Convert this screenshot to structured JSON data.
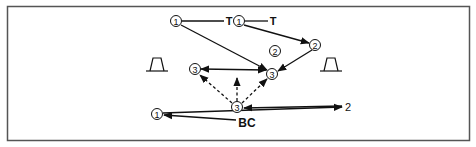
{
  "diagram": {
    "type": "traffic/route flow diagram",
    "border_color": "#555555",
    "line_color": "#111111",
    "nodes": [
      {
        "id": "n1a",
        "label": "1",
        "shape": "circle",
        "x": 176,
        "y": 21
      },
      {
        "id": "t1",
        "label": "T",
        "shape": "text",
        "x": 229,
        "y": 21
      },
      {
        "id": "n1b",
        "label": "1",
        "shape": "circle",
        "x": 239,
        "y": 21
      },
      {
        "id": "t2",
        "label": "T",
        "shape": "text",
        "x": 273,
        "y": 21
      },
      {
        "id": "n2a",
        "label": "2",
        "shape": "circle",
        "x": 275,
        "y": 51
      },
      {
        "id": "n2b",
        "label": "2",
        "shape": "circle",
        "x": 315,
        "y": 45
      },
      {
        "id": "n3a",
        "label": "3",
        "shape": "circle",
        "x": 195,
        "y": 69
      },
      {
        "id": "n3b",
        "label": "3",
        "shape": "circle",
        "x": 272,
        "y": 74
      },
      {
        "id": "n3c",
        "label": "3",
        "shape": "circle",
        "x": 237,
        "y": 107
      },
      {
        "id": "n1c",
        "label": "1",
        "shape": "circle",
        "x": 157,
        "y": 114
      },
      {
        "id": "plain2",
        "label": "2",
        "shape": "text",
        "x": 348,
        "y": 107
      },
      {
        "id": "bc",
        "label": "BC",
        "shape": "text",
        "x": 246,
        "y": 122
      }
    ],
    "symbols": [
      {
        "name": "trapezoid-left",
        "x": 156,
        "y": 64
      },
      {
        "name": "trapezoid-right",
        "x": 330,
        "y": 64
      }
    ],
    "edges": [
      {
        "from": "n1a",
        "to": "t1",
        "style": "solid",
        "arrow": "none"
      },
      {
        "from": "n1b",
        "to": "t2",
        "style": "solid",
        "arrow": "none"
      },
      {
        "from": "n1a",
        "to": "n3b",
        "style": "solid",
        "arrow": "end"
      },
      {
        "from": "n1b",
        "to": "n2b",
        "style": "solid",
        "arrow": "end"
      },
      {
        "from": "n2b",
        "to": "n3b",
        "style": "solid",
        "arrow": "end"
      },
      {
        "from": "n3a",
        "to": "n3b",
        "style": "solid",
        "arrow": "both"
      },
      {
        "from": "n3c",
        "to": "n3a",
        "style": "dashed",
        "arrow": "end"
      },
      {
        "from": "n3c",
        "to": "up",
        "style": "dashed",
        "arrow": "end"
      },
      {
        "from": "n3c",
        "to": "n3b",
        "style": "dashed",
        "arrow": "end"
      },
      {
        "from": "plain2",
        "to": "n3c",
        "style": "solid",
        "arrow": "end"
      },
      {
        "from": "n1c",
        "to": "plain2",
        "style": "solid",
        "arrow": "end"
      },
      {
        "from": "bc",
        "to": "n1c",
        "style": "solid",
        "arrow": "end"
      }
    ]
  },
  "labels": {
    "n1a": "1",
    "t1": "T",
    "n1b": "1",
    "t2": "T",
    "n2a": "2",
    "n2b": "2",
    "n3a": "3",
    "n3b": "3",
    "n3c": "3",
    "n1c": "1",
    "plain2": "2",
    "bc": "BC"
  }
}
